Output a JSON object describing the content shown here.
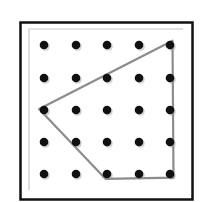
{
  "geoboard": {
    "rows": 5,
    "cols": 5,
    "peg_x": [
      44,
      76,
      107,
      139,
      170
    ],
    "peg_y": [
      45,
      78,
      110,
      142,
      174
    ],
    "frame": {
      "x": 20,
      "y": 22,
      "width": 172,
      "height": 177,
      "color": "#111111"
    },
    "inner_line_color": "#bdbdbd",
    "peg_color": "#111111",
    "band": {
      "color": "#8c8c8c",
      "vertices": [
        [
          170,
          45
        ],
        [
          44,
          110
        ],
        [
          107,
          174
        ],
        [
          170,
          174
        ]
      ]
    }
  }
}
